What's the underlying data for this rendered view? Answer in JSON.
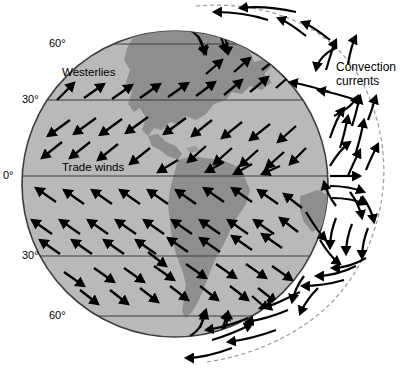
{
  "figure": {
    "type": "diagram",
    "background_color": "#ffffff"
  },
  "globe": {
    "ocean_color": "#b9b9b9",
    "land_color": "#8e8e8e",
    "outline_color": "#3d3d3d",
    "center_x": 175,
    "center_y": 184,
    "radius": 153
  },
  "latitude_lines": [
    {
      "label": "60°",
      "hemisphere": "north",
      "y": 44,
      "label_x": 49,
      "label_y": 38
    },
    {
      "label": "30°",
      "hemisphere": "north",
      "y": 100,
      "label_x": 22,
      "label_y": 94
    },
    {
      "label": "0°",
      "hemisphere": "equator",
      "y": 176,
      "label_x": 4,
      "label_y": 170
    },
    {
      "label": "30°",
      "hemisphere": "south",
      "y": 256,
      "label_x": 22,
      "label_y": 250
    },
    {
      "label": "60°",
      "hemisphere": "south",
      "y": 316,
      "label_x": 49,
      "label_y": 310
    }
  ],
  "wind_labels": [
    {
      "name": "westerlies",
      "text": "Westerlies",
      "x": 62,
      "y": 66
    },
    {
      "name": "trade-winds",
      "text": "Trade winds",
      "x": 62,
      "y": 161
    }
  ],
  "annotations": [
    {
      "name": "convection-currents",
      "lines": [
        "Convection",
        "currents"
      ],
      "x": 336,
      "y": 60
    }
  ],
  "colors": {
    "arrow": "#000000",
    "latitude_line": "#3d3d3d",
    "atmosphere_dashed": "#9a9a9a"
  },
  "wind_bands": [
    {
      "name": "polar-easterlies-north",
      "range": "60°N-90°N",
      "direction": "southwest"
    },
    {
      "name": "westerlies-north",
      "range": "30°N-60°N",
      "direction": "northeast"
    },
    {
      "name": "trade-winds-north",
      "range": "0°-30°N",
      "direction": "southwest"
    },
    {
      "name": "trade-winds-south",
      "range": "0°-30°S",
      "direction": "northwest"
    },
    {
      "name": "westerlies-south",
      "range": "30°S-60°S",
      "direction": "southeast"
    },
    {
      "name": "polar-easterlies-south",
      "range": "60°S-90°S",
      "direction": "northwest"
    }
  ],
  "convection_cells": [
    {
      "name": "polar-cell-north",
      "center_y": 52
    },
    {
      "name": "ferrel-cell-north",
      "center_y": 118
    },
    {
      "name": "hadley-cell-north",
      "center_y": 160
    },
    {
      "name": "hadley-cell-south",
      "center_y": 210
    },
    {
      "name": "ferrel-cell-south",
      "center_y": 262
    },
    {
      "name": "polar-cell-south",
      "center_y": 320
    }
  ]
}
